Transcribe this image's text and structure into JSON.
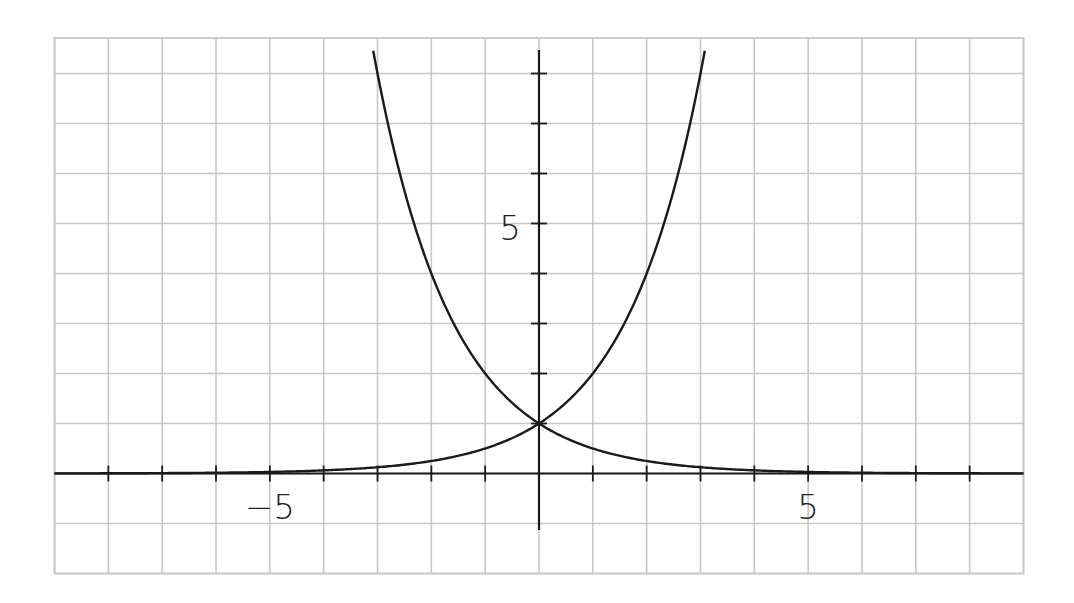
{
  "chart_data": {
    "type": "line",
    "title": "",
    "xlabel": "",
    "ylabel": "",
    "xlim": [
      -9,
      9
    ],
    "ylim": [
      -2,
      8.7
    ],
    "grid": true,
    "grid_step": 1,
    "x_ticks": [
      -8,
      -7,
      -6,
      -5,
      -4,
      -3,
      -2,
      -1,
      1,
      2,
      3,
      4,
      5,
      6,
      7,
      8
    ],
    "y_ticks": [
      1,
      2,
      3,
      4,
      5,
      6,
      7,
      8
    ],
    "tick_labels": {
      "x": [
        {
          "value": -5,
          "label": "−5"
        },
        {
          "value": 5,
          "label": "5"
        }
      ],
      "y": [
        {
          "value": 5,
          "label": "5"
        }
      ]
    },
    "legend": [],
    "series": [
      {
        "name": "2^x",
        "description": "increasing exponential",
        "x": [
          -9,
          -8,
          -7,
          -6,
          -5,
          -4,
          -3,
          -2,
          -1,
          0,
          1,
          2,
          3,
          3.08
        ],
        "y": [
          0.002,
          0.004,
          0.008,
          0.016,
          0.031,
          0.0625,
          0.125,
          0.25,
          0.5,
          1,
          2,
          4,
          8,
          8.45
        ]
      },
      {
        "name": "2^(-x)",
        "description": "decreasing exponential",
        "x": [
          -3.08,
          -3,
          -2,
          -1,
          0,
          1,
          2,
          3,
          4,
          5,
          6,
          7,
          8,
          9
        ],
        "y": [
          8.45,
          8,
          4,
          2,
          1,
          0.5,
          0.25,
          0.125,
          0.0625,
          0.031,
          0.016,
          0.008,
          0.004,
          0.002
        ]
      }
    ],
    "intersection": {
      "x": 0,
      "y": 1
    },
    "colors": {
      "grid": "#c8c8c8",
      "axis": "#1a1a1a",
      "curve": "#1a1a1a",
      "background": "#ffffff",
      "label": "#222222"
    }
  }
}
